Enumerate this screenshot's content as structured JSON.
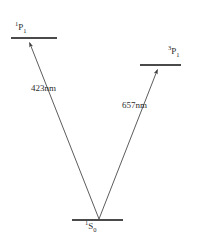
{
  "diagram": {
    "type": "atomic-energy-level-diagram",
    "background_color": "#ffffff",
    "line_color": "#4a4a4a",
    "text_color": "#2b2b2b",
    "levels": [
      {
        "id": "excited-singlet",
        "label_term": "P",
        "label_superscript": "1",
        "label_subscript": "1",
        "label_text": "¹P₁",
        "line_x1": 11,
        "line_x2": 57,
        "line_y": 38
      },
      {
        "id": "excited-triplet",
        "label_term": "P",
        "label_superscript": "3",
        "label_subscript": "1",
        "label_text": "³P₁",
        "line_x1": 140,
        "line_x2": 181,
        "line_y": 65
      },
      {
        "id": "ground-singlet",
        "label_term": "S",
        "label_superscript": "1",
        "label_subscript": "0",
        "label_text": "¹S₀",
        "line_x1": 72,
        "line_x2": 123,
        "line_y": 220
      }
    ],
    "transitions": [
      {
        "id": "transition-423",
        "label": "423nm",
        "from_level": "ground-singlet",
        "to_level": "excited-singlet",
        "x1": 99,
        "y1": 220,
        "x2": 28,
        "y2": 40
      },
      {
        "id": "transition-657",
        "label": "657nm",
        "from_level": "ground-singlet",
        "to_level": "excited-triplet",
        "x1": 99,
        "y1": 220,
        "x2": 159,
        "y2": 67
      }
    ]
  }
}
